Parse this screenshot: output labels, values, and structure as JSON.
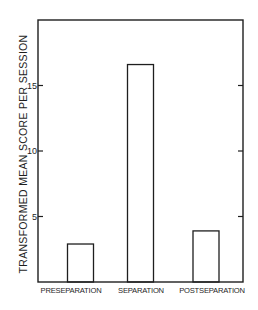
{
  "chart_data": {
    "type": "bar",
    "title": "",
    "xlabel": "",
    "ylabel": "TRANSFORMED MEAN SCORE PER SESSION",
    "categories": [
      "PRESEPARATION",
      "SEPARATION",
      "POSTSEPARATION"
    ],
    "values": [
      2.9,
      16.6,
      3.9
    ],
    "ylim": [
      0,
      20
    ],
    "yticks": [
      5,
      10,
      15
    ],
    "ytick_labels": [
      "5",
      "10",
      "15"
    ],
    "grid": false,
    "legend": null,
    "bar_fill": "#ffffff",
    "bar_stroke": "#1e1e1e"
  }
}
